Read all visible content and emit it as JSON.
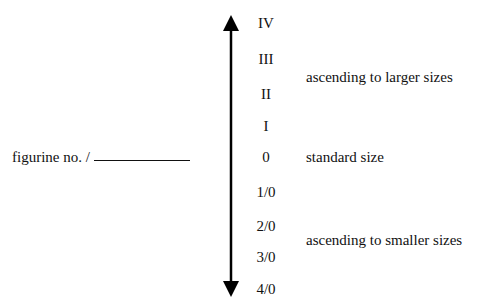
{
  "diagram": {
    "scale_labels": [
      "IV",
      "III",
      "II",
      "I",
      "0",
      "1/0",
      "2/0",
      "3/0",
      "4/0"
    ],
    "upper_description": "ascending to larger sizes",
    "middle_description": "standard size",
    "lower_description": "ascending to smaller sizes",
    "left_label": "figurine no. /",
    "arrow": {
      "direction": "bidirectional-vertical",
      "color": "#000000"
    }
  }
}
